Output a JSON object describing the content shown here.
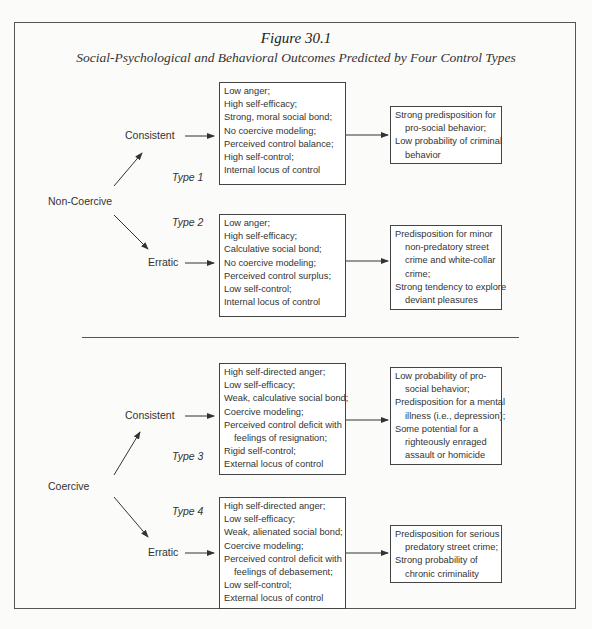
{
  "figure": {
    "title": "Figure 30.1",
    "subtitle": "Social-Psychological and Behavioral Outcomes Predicted by Four Control Types"
  },
  "groups": [
    {
      "name": "Non-Coercive",
      "branches": [
        {
          "label": "Consistent",
          "type": "Type 1",
          "traits": [
            "Low anger;",
            "High self-efficacy;",
            "Strong, moral social bond;",
            "No coercive modeling;",
            "Perceived control balance;",
            "High self-control;",
            "Internal locus of control"
          ],
          "outcomes": [
            {
              "text": "Strong predisposition for",
              "indent": false
            },
            {
              "text": "pro-social behavior;",
              "indent": true
            },
            {
              "text": "Low probability of criminal",
              "indent": false
            },
            {
              "text": "behavior",
              "indent": true
            }
          ]
        },
        {
          "label": "Erratic",
          "type": "Type 2",
          "traits": [
            "Low anger;",
            "High self-efficacy;",
            "Calculative social bond;",
            "No coercive modeling;",
            "Perceived control surplus;",
            "Low self-control;",
            "Internal locus of control"
          ],
          "outcomes": [
            {
              "text": "Predisposition for minor",
              "indent": false
            },
            {
              "text": "non-predatory street",
              "indent": true
            },
            {
              "text": "crime and white-collar",
              "indent": true
            },
            {
              "text": "crime;",
              "indent": true
            },
            {
              "text": "Strong tendency to explore",
              "indent": false
            },
            {
              "text": "deviant pleasures",
              "indent": true
            }
          ]
        }
      ]
    },
    {
      "name": "Coercive",
      "branches": [
        {
          "label": "Consistent",
          "type": "Type 3",
          "traits": [
            "High self-directed anger;",
            "Low self-efficacy;",
            "Weak, calculative social bond;",
            "Coercive modeling;",
            "Perceived control deficit with",
            "   feelings of resignation;",
            "Rigid self-control;",
            "External locus of control"
          ],
          "outcomes": [
            {
              "text": "Low probability of pro-",
              "indent": false
            },
            {
              "text": "social behavior;",
              "indent": true
            },
            {
              "text": "Predisposition for a mental",
              "indent": false
            },
            {
              "text": "illness (i.e., depression);",
              "indent": true
            },
            {
              "text": "Some potential for a",
              "indent": false
            },
            {
              "text": "righteously enraged",
              "indent": true
            },
            {
              "text": "assault or homicide",
              "indent": true
            }
          ]
        },
        {
          "label": "Erratic",
          "type": "Type 4",
          "traits": [
            "High self-directed anger;",
            "Low self-efficacy;",
            "Weak, alienated social bond;",
            "Coercive modeling;",
            "Perceived control deficit with",
            "   feelings of debasement;",
            "Low self-control;",
            "External locus of control"
          ],
          "outcomes": [
            {
              "text": "Predisposition for serious",
              "indent": false
            },
            {
              "text": "predatory street crime;",
              "indent": true
            },
            {
              "text": "Strong probability of",
              "indent": false
            },
            {
              "text": "chronic criminality",
              "indent": true
            }
          ]
        }
      ]
    }
  ]
}
